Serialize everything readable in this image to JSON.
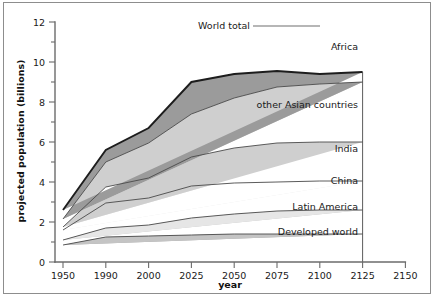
{
  "chart_data": {
    "type": "area",
    "stacked": true,
    "title": "",
    "xlabel": "year",
    "ylabel": "projected population (billions)",
    "x": [
      1950,
      1990,
      2000,
      2025,
      2050,
      2075,
      2100,
      2125
    ],
    "categories": [
      "1950",
      "1990",
      "2000",
      "2025",
      "2050",
      "2075",
      "2100",
      "2125"
    ],
    "xtick_labels": [
      "1950",
      "1990",
      "2000",
      "2025",
      "2050",
      "2075",
      "2100",
      "2125",
      "2150"
    ],
    "ytick_labels": [
      "0",
      "2",
      "4",
      "6",
      "8",
      "10",
      "12"
    ],
    "ytick_values": [
      0,
      2,
      4,
      6,
      8,
      10,
      12
    ],
    "ylim": [
      0,
      12
    ],
    "grid": false,
    "legend": "inline-band-labels",
    "axis_note": "x-axis ticks are evenly spaced categorically, not proportional to elapsed years",
    "series": [
      {
        "name": "Developed world",
        "color": "#a8a8a8",
        "values": [
          0.85,
          1.25,
          1.3,
          1.35,
          1.4,
          1.4,
          1.4,
          1.4
        ]
      },
      {
        "name": "Latin America",
        "color": "#c4c4c4",
        "values": [
          0.25,
          0.45,
          0.55,
          0.85,
          1.0,
          1.15,
          1.2,
          1.2
        ]
      },
      {
        "name": "China",
        "color": "#e6e6e6",
        "values": [
          0.5,
          1.25,
          1.35,
          1.6,
          1.55,
          1.45,
          1.45,
          1.45
        ]
      },
      {
        "name": "India",
        "color": "#ffffff",
        "values": [
          0.15,
          0.8,
          1.0,
          1.45,
          1.75,
          1.95,
          1.95,
          1.95
        ]
      },
      {
        "name": "other Asian countries",
        "color": "#cfcfcf",
        "values": [
          0.4,
          1.25,
          1.75,
          2.15,
          2.5,
          2.8,
          2.9,
          3.0
        ]
      },
      {
        "name": "Africa",
        "color": "#9b9b9b",
        "values": [
          0.45,
          0.6,
          0.75,
          1.6,
          1.2,
          0.8,
          0.5,
          0.5
        ]
      }
    ],
    "cumulative_totals": {
      "label": "World total",
      "values": [
        2.6,
        5.6,
        6.7,
        9.0,
        10.2,
        11.0,
        11.4,
        11.5
      ]
    },
    "annotations": [
      {
        "text": "World total",
        "kind": "callout-with-leader-line"
      }
    ]
  },
  "labels": {
    "y_axis_title": "projected population (billions)",
    "x_axis_title": "year",
    "world_total": "World total",
    "africa": "Africa",
    "other_asian": "other Asian countries",
    "india": "India",
    "china": "China",
    "latin_america": "Latin America",
    "developed_world": "Developed world"
  },
  "colors": {
    "africa": "#9b9b9b",
    "other_asian": "#cfcfcf",
    "india": "#ffffff",
    "china": "#e6e6e6",
    "latin_america": "#c4c4c4",
    "developed_world": "#a8a8a8",
    "axis": "#6b6b6b",
    "outline": "#4a4a4a",
    "top_outline": "#1d1d1d",
    "text": "#1a1a1a",
    "frame": "#8d8d8d",
    "background": "#ffffff"
  }
}
